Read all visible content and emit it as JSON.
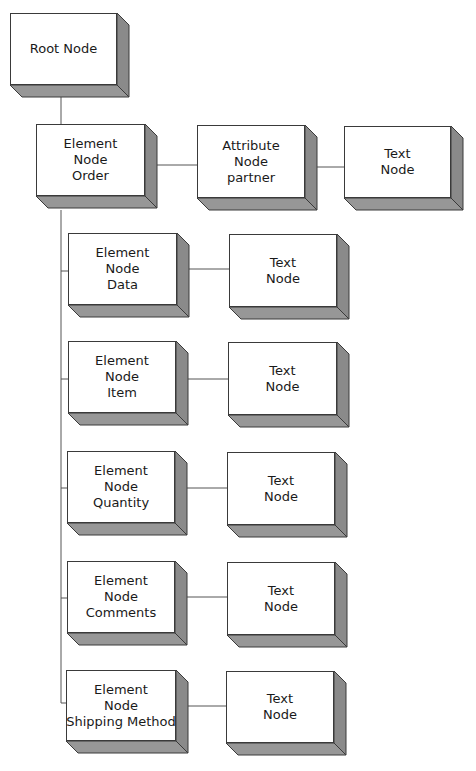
{
  "diagram": {
    "title": "",
    "colors": {
      "face": "#ffffff",
      "shade_side": "#8a8a8a",
      "shade_bottom": "#979797",
      "outline": "#3a3a3a",
      "connector": "#555555"
    },
    "depth": 12,
    "nodes": [
      {
        "id": "root",
        "lines": [
          "Root Node"
        ],
        "x": 10,
        "y": 13,
        "w": 107,
        "h": 72
      },
      {
        "id": "element-order",
        "lines": [
          "Element",
          "Node",
          "Order"
        ],
        "x": 36,
        "y": 124,
        "w": 109,
        "h": 72
      },
      {
        "id": "attribute-partner",
        "lines": [
          "Attribute",
          "Node",
          "partner"
        ],
        "x": 197,
        "y": 125,
        "w": 108,
        "h": 73
      },
      {
        "id": "text-partner",
        "lines": [
          "Text",
          "Node"
        ],
        "x": 344,
        "y": 126,
        "w": 107,
        "h": 72
      },
      {
        "id": "element-data",
        "lines": [
          "Element",
          "Node",
          "Data"
        ],
        "x": 68,
        "y": 233,
        "w": 109,
        "h": 72
      },
      {
        "id": "text-data",
        "lines": [
          "Text",
          "Node"
        ],
        "x": 229,
        "y": 234,
        "w": 108,
        "h": 73
      },
      {
        "id": "element-item",
        "lines": [
          "Element",
          "Node",
          "Item"
        ],
        "x": 68,
        "y": 341,
        "w": 108,
        "h": 72
      },
      {
        "id": "text-item",
        "lines": [
          "Text",
          "Node"
        ],
        "x": 228,
        "y": 342,
        "w": 109,
        "h": 73
      },
      {
        "id": "element-quantity",
        "lines": [
          "Element",
          "Node",
          "Quantity"
        ],
        "x": 67,
        "y": 451,
        "w": 108,
        "h": 72
      },
      {
        "id": "text-quantity",
        "lines": [
          "Text",
          "Node"
        ],
        "x": 227,
        "y": 452,
        "w": 108,
        "h": 73
      },
      {
        "id": "element-comments",
        "lines": [
          "Element",
          "Node",
          "Comments"
        ],
        "x": 67,
        "y": 561,
        "w": 108,
        "h": 72
      },
      {
        "id": "text-comments",
        "lines": [
          "Text",
          "Node"
        ],
        "x": 227,
        "y": 562,
        "w": 108,
        "h": 73
      },
      {
        "id": "element-shipping-method",
        "lines": [
          "Element",
          "Node",
          "Shipping Method"
        ],
        "x": 66,
        "y": 670,
        "w": 110,
        "h": 71
      },
      {
        "id": "text-shipping-method",
        "lines": [
          "Text",
          "Node"
        ],
        "x": 226,
        "y": 671,
        "w": 108,
        "h": 72
      }
    ],
    "connectors": [
      {
        "from": "root",
        "to": "element-order",
        "points": [
          [
            61,
            97
          ],
          [
            61,
            124
          ]
        ]
      },
      {
        "from": "element-order",
        "to": "attribute-partner",
        "points": [
          [
            151,
            165
          ],
          [
            197,
            165
          ]
        ]
      },
      {
        "from": "attribute-partner",
        "to": "text-partner",
        "points": [
          [
            311,
            167
          ],
          [
            344,
            167
          ]
        ]
      },
      {
        "from": "element-order",
        "to": "element-data",
        "points": [
          [
            61,
            210
          ],
          [
            61,
            271
          ],
          [
            68,
            271
          ]
        ]
      },
      {
        "from": "element-order",
        "to": "element-item",
        "points": [
          [
            61,
            379
          ],
          [
            68,
            379
          ]
        ]
      },
      {
        "from": "element-order",
        "to": "element-quantity",
        "points": [
          [
            61,
            488
          ],
          [
            67,
            488
          ]
        ]
      },
      {
        "from": "element-order",
        "to": "element-comments",
        "points": [
          [
            61,
            598
          ],
          [
            67,
            598
          ]
        ]
      },
      {
        "from": "element-order",
        "to": "element-shipping-method",
        "points": [
          [
            61,
            271
          ],
          [
            61,
            703
          ],
          [
            66,
            703
          ]
        ]
      },
      {
        "from": "element-data",
        "to": "text-data",
        "points": [
          [
            183,
            269
          ],
          [
            229,
            269
          ]
        ]
      },
      {
        "from": "element-item",
        "to": "text-item",
        "points": [
          [
            182,
            379
          ],
          [
            228,
            379
          ]
        ]
      },
      {
        "from": "element-quantity",
        "to": "text-quantity",
        "points": [
          [
            181,
            488
          ],
          [
            227,
            488
          ]
        ]
      },
      {
        "from": "element-comments",
        "to": "text-comments",
        "points": [
          [
            181,
            597
          ],
          [
            227,
            597
          ]
        ]
      },
      {
        "from": "element-shipping-method",
        "to": "text-shipping-method",
        "points": [
          [
            182,
            706
          ],
          [
            226,
            706
          ]
        ]
      }
    ]
  }
}
